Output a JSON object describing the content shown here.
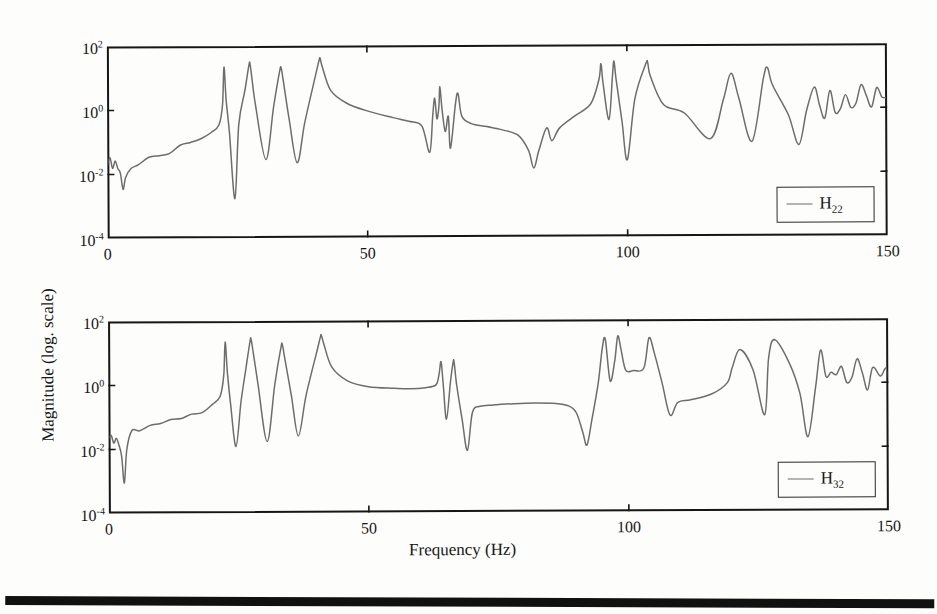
{
  "figure": {
    "xlabel": "Frequency (Hz)",
    "ylabel": "Magnitude (log. scale)",
    "xticks": [
      "0",
      "50",
      "100",
      "150"
    ],
    "yticks": [
      "10",
      "10",
      "10",
      "10"
    ],
    "yexp": [
      "2",
      "0",
      "-2",
      "-4"
    ],
    "line_color": "#6d6d6d",
    "axis_color": "#161616"
  },
  "panels": [
    {
      "legend_base": "H",
      "legend_sub": "22"
    },
    {
      "legend_base": "H",
      "legend_sub": "32"
    }
  ],
  "chart_data": {
    "type": "line",
    "title": "",
    "xlabel": "Frequency (Hz)",
    "ylabel": "Magnitude (log. scale)",
    "xlim": [
      0,
      150
    ],
    "ylim": [
      0.0001,
      100
    ],
    "yscale": "log",
    "xticks": [
      0,
      50,
      100,
      150
    ],
    "yticks": [
      0.0001,
      0.01,
      1,
      100
    ],
    "grid": false,
    "legend_position": "lower-right",
    "subplots": [
      {
        "name": "H22",
        "legend": "H22",
        "resonances_hz": [
          22.5,
          27.5,
          33.5,
          41.0,
          63.0,
          64.0,
          65.0,
          67.5,
          84.5,
          95.0,
          97.5,
          104.0,
          120.0,
          127.0,
          136.0,
          140.0,
          143.0,
          146.0,
          148.0
        ],
        "antiresonances_hz": [
          3.0,
          24.5,
          30.5,
          36.5,
          62.0,
          66.0,
          82.0,
          96.5,
          100.0,
          116.0,
          124.0,
          133.0
        ],
        "series": [
          {
            "name": "H22",
            "x": [
              0.0,
              0.5,
              1.0,
              1.5,
              2.0,
              2.5,
              3.0,
              3.5,
              4.5,
              6.0,
              8.0,
              10.0,
              12.0,
              14.0,
              16.0,
              18.0,
              20.0,
              21.5,
              22.2,
              22.5,
              22.9,
              23.5,
              24.5,
              25.3,
              26.5,
              27.3,
              27.5,
              27.8,
              28.6,
              30.5,
              32.0,
              33.2,
              33.5,
              33.9,
              35.0,
              36.5,
              38.0,
              40.0,
              40.8,
              41.0,
              41.4,
              43.0,
              46.0,
              50.0,
              55.0,
              58.0,
              60.5,
              62.0,
              62.6,
              63.0,
              63.4,
              63.8,
              64.0,
              64.4,
              65.0,
              65.6,
              66.0,
              67.0,
              67.5,
              68.2,
              70.0,
              73.0,
              76.0,
              79.0,
              81.0,
              82.0,
              83.0,
              84.5,
              85.5,
              87.0,
              90.0,
              93.0,
              94.6,
              95.0,
              95.4,
              96.5,
              97.2,
              97.5,
              97.9,
              99.0,
              100.0,
              101.5,
              103.6,
              104.0,
              104.5,
              107.0,
              111.0,
              116.0,
              118.5,
              120.0,
              121.5,
              124.0,
              126.2,
              127.0,
              128.0,
              131.0,
              133.0,
              134.5,
              136.0,
              137.0,
              138.0,
              139.0,
              140.0,
              141.0,
              142.0,
              143.0,
              144.0,
              145.0,
              146.0,
              147.0,
              148.0,
              149.0,
              150.0
            ],
            "y": [
              0.022,
              0.03,
              0.018,
              0.026,
              0.016,
              0.011,
              0.0033,
              0.009,
              0.016,
              0.02,
              0.03,
              0.035,
              0.05,
              0.07,
              0.09,
              0.13,
              0.2,
              0.35,
              1.5,
              22.0,
              2.0,
              0.2,
              0.0017,
              0.35,
              4.0,
              25.0,
              28.0,
              12.0,
              1.2,
              0.028,
              1.2,
              16.0,
              20.0,
              8.0,
              0.5,
              0.022,
              0.4,
              10.0,
              35.0,
              40.0,
              22.0,
              4.0,
              1.6,
              0.9,
              0.55,
              0.42,
              0.3,
              0.045,
              0.6,
              2.2,
              0.5,
              1.2,
              5.0,
              1.0,
              0.2,
              0.6,
              0.06,
              1.5,
              3.0,
              0.6,
              0.35,
              0.28,
              0.22,
              0.15,
              0.05,
              0.014,
              0.05,
              0.25,
              0.1,
              0.25,
              0.6,
              1.4,
              8.0,
              25.0,
              6.0,
              0.45,
              10.0,
              30.0,
              8.0,
              0.4,
              0.025,
              2.0,
              24.0,
              26.0,
              10.0,
              1.3,
              0.7,
              0.11,
              1.8,
              12.0,
              2.0,
              0.09,
              8.0,
              18.0,
              5.0,
              0.6,
              0.07,
              0.9,
              5.0,
              1.2,
              0.5,
              3.0,
              0.8,
              1.0,
              2.5,
              0.9,
              1.4,
              5.0,
              2.2,
              0.9,
              4.5,
              2.0,
              2.3
            ]
          }
        ]
      },
      {
        "name": "H32",
        "legend": "H32",
        "resonances_hz": [
          22.5,
          27.5,
          33.5,
          41.0,
          64.0,
          66.5,
          95.0,
          98.0,
          104.0,
          120.0,
          127.0,
          136.0,
          140.0,
          143.0,
          146.0,
          148.5
        ],
        "antiresonances_hz": [
          3.0,
          24.5,
          30.5,
          36.5,
          65.0,
          69.0,
          92.0,
          108.0,
          124.0,
          133.0
        ],
        "series": [
          {
            "name": "H32",
            "x": [
              0.0,
              0.5,
              1.0,
              1.5,
              2.0,
              2.5,
              3.0,
              3.5,
              4.5,
              6.0,
              8.0,
              10.0,
              12.0,
              14.0,
              16.0,
              18.0,
              20.0,
              21.5,
              22.2,
              22.5,
              22.9,
              23.5,
              24.5,
              25.5,
              26.5,
              27.3,
              27.5,
              27.9,
              28.8,
              30.5,
              32.0,
              33.2,
              33.5,
              34.0,
              35.2,
              36.5,
              38.0,
              40.0,
              40.8,
              41.0,
              41.5,
              43.0,
              46.0,
              50.0,
              55.0,
              58.0,
              61.0,
              63.0,
              63.6,
              64.0,
              64.4,
              65.0,
              65.8,
              66.3,
              66.5,
              67.0,
              68.0,
              69.0,
              70.0,
              71.5,
              74.0,
              78.0,
              82.0,
              86.0,
              88.5,
              90.0,
              91.2,
              92.0,
              93.0,
              94.2,
              95.0,
              95.6,
              96.5,
              97.4,
              98.0,
              98.6,
              99.5,
              101.0,
              103.0,
              104.0,
              105.0,
              106.5,
              108.0,
              109.5,
              112.0,
              116.0,
              119.0,
              120.0,
              121.5,
              124.0,
              126.2,
              127.0,
              128.2,
              131.0,
              133.0,
              134.5,
              136.0,
              137.0,
              138.0,
              139.0,
              140.0,
              141.0,
              142.0,
              143.0,
              144.0,
              145.0,
              146.0,
              147.0,
              148.5,
              149.5,
              150.0
            ],
            "y": [
              0.025,
              0.032,
              0.016,
              0.024,
              0.012,
              0.007,
              0.001,
              0.01,
              0.035,
              0.04,
              0.055,
              0.06,
              0.075,
              0.1,
              0.12,
              0.16,
              0.25,
              0.45,
              2.0,
              22.0,
              2.5,
              0.25,
              0.012,
              0.3,
              3.5,
              24.0,
              26.0,
              10.0,
              1.0,
              0.017,
              1.0,
              14.0,
              18.0,
              6.0,
              0.45,
              0.025,
              0.45,
              9.0,
              30.0,
              35.0,
              18.0,
              3.5,
              1.3,
              0.85,
              0.75,
              0.72,
              0.78,
              0.95,
              2.0,
              5.0,
              1.0,
              0.08,
              1.2,
              4.5,
              5.0,
              0.9,
              0.08,
              0.0085,
              0.13,
              0.2,
              0.22,
              0.24,
              0.25,
              0.24,
              0.2,
              0.12,
              0.03,
              0.012,
              0.08,
              1.0,
              12.0,
              24.0,
              1.2,
              5.0,
              30.0,
              12.0,
              2.6,
              2.5,
              3.0,
              26.0,
              9.0,
              1.0,
              0.1,
              0.25,
              0.3,
              0.45,
              1.0,
              3.0,
              11.0,
              2.5,
              0.1,
              6.0,
              22.0,
              4.0,
              0.45,
              0.02,
              0.8,
              9.0,
              1.5,
              2.2,
              1.6,
              3.5,
              1.0,
              1.4,
              6.0,
              2.0,
              0.6,
              2.6,
              1.5,
              3.0,
              1.2,
              2.0
            ]
          }
        ]
      }
    ]
  }
}
